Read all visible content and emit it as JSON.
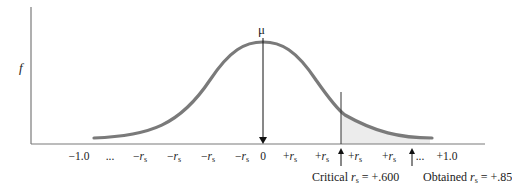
{
  "diagram": {
    "type": "normal-distribution-sampling",
    "y_axis_label": "f",
    "mean_label": "μ",
    "x_ticks": [
      {
        "text": "−1.0",
        "x": 79
      },
      {
        "text": "...",
        "x": 110
      },
      {
        "text": "−r",
        "sub": "s",
        "x": 140
      },
      {
        "text": "−r",
        "sub": "s",
        "x": 174
      },
      {
        "text": "−r",
        "sub": "s",
        "x": 208
      },
      {
        "text": "−r",
        "sub": "s",
        "x": 242
      },
      {
        "text": "0",
        "x": 263
      },
      {
        "text": "+r",
        "sub": "s",
        "x": 290
      },
      {
        "text": "+r",
        "sub": "s",
        "x": 322
      },
      {
        "text": "+r",
        "sub": "s",
        "x": 355
      },
      {
        "text": "+r",
        "sub": "s",
        "x": 389
      },
      {
        "text": "...",
        "x": 420
      },
      {
        "text": "+1.0",
        "x": 447
      }
    ],
    "critical": {
      "prefix": "Critical ",
      "var": "r",
      "sub": "s",
      "value": " = +.600"
    },
    "obtained": {
      "prefix": "Obtained ",
      "var": "r",
      "sub": "s",
      "value": " = +.85"
    },
    "colors": {
      "curve": "#7a7a7a",
      "axis": "#7a7a7a",
      "shade": "#ececec",
      "arrow": "#111111"
    }
  },
  "chart_data": {
    "type": "line",
    "title": "",
    "xlabel": "",
    "ylabel": "f",
    "x_tick_labels": [
      "−1.0",
      "...",
      "−r_s",
      "−r_s",
      "−r_s",
      "−r_s",
      "0",
      "+r_s",
      "+r_s",
      "+r_s",
      "+r_s",
      "...",
      "+1.0"
    ],
    "annotations": [
      "μ",
      "Critical r_s = +.600",
      "Obtained r_s = +.85"
    ],
    "xlim": [
      -1.0,
      1.0
    ],
    "critical_value": 0.6,
    "obtained_value": 0.85,
    "grid": false,
    "legend": "none"
  }
}
